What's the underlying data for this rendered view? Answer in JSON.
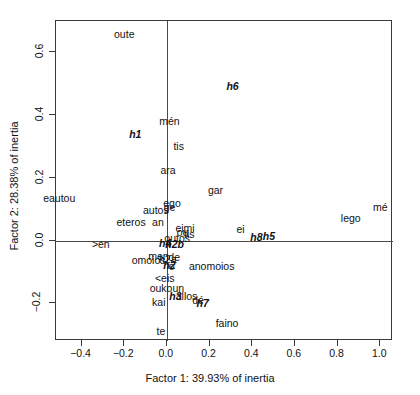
{
  "chart_data": {
    "type": "scatter",
    "title": "",
    "subtitle": "",
    "xlabel": "Factor 1: 39.93% of inertia",
    "ylabel": "Factor 2: 28.38% of inertia",
    "xlim": [
      -0.52,
      1.06
    ],
    "ylim": [
      -0.32,
      0.7
    ],
    "grid": false,
    "legend": "none",
    "xticks": [
      "-0.4",
      "-0.2",
      "0.0",
      "0.2",
      "0.4",
      "0.6",
      "0.8",
      "1.0"
    ],
    "xtick_values": [
      -0.4,
      -0.2,
      0.0,
      0.2,
      0.4,
      0.6,
      0.8,
      1.0
    ],
    "yticks": [
      "-0.2",
      "0.0",
      "0.2",
      "0.4",
      "0.6"
    ],
    "ytick_values": [
      -0.2,
      0.0,
      0.2,
      0.4,
      0.6
    ],
    "reference_lines": {
      "vertical_x": 0.0,
      "horizontal_y": 0.0
    },
    "series": [
      {
        "name": "words",
        "style": "plain",
        "points": [
          {
            "label": "oute",
            "x": -0.2,
            "y": 0.66
          },
          {
            "label": "mén",
            "x": 0.012,
            "y": 0.38
          },
          {
            "label": "tis",
            "x": 0.055,
            "y": 0.3
          },
          {
            "label": "ara",
            "x": 0.005,
            "y": 0.225
          },
          {
            "label": "gar",
            "x": 0.228,
            "y": 0.16
          },
          {
            "label": "eautou",
            "x": -0.505,
            "y": 0.137
          },
          {
            "label": "ego",
            "x": 0.024,
            "y": 0.12
          },
          {
            "label": "ge",
            "x": 0.012,
            "y": 0.108
          },
          {
            "label": "autos",
            "x": -0.052,
            "y": 0.098
          },
          {
            "label": "mé",
            "x": 1.0,
            "y": 0.108
          },
          {
            "label": "lego",
            "x": 0.862,
            "y": 0.072
          },
          {
            "label": "eteros",
            "x": -0.168,
            "y": 0.058
          },
          {
            "label": "an",
            "x": -0.042,
            "y": 0.058
          },
          {
            "label": "eimi",
            "x": 0.085,
            "y": 0.04
          },
          {
            "label": "ou",
            "x": 0.073,
            "y": 0.026
          },
          {
            "label": "tis",
            "x": 0.105,
            "y": 0.022
          },
          {
            "label": "ei",
            "x": 0.345,
            "y": 0.036
          },
          {
            "label": "outos",
            "x": 0.048,
            "y": 0.008
          },
          {
            "label": ">en",
            "x": -0.31,
            "y": -0.01
          },
          {
            "label": "de",
            "x": 0.034,
            "y": -0.052
          },
          {
            "label": "men",
            "x": -0.04,
            "y": -0.048
          },
          {
            "label": "h2a",
            "x": 0.004,
            "y": -0.06
          },
          {
            "label": "omoios",
            "x": -0.086,
            "y": -0.062
          },
          {
            "label": "o",
            "x": 0.022,
            "y": -0.082
          },
          {
            "label": "anomoios",
            "x": 0.21,
            "y": -0.082
          },
          {
            "label": "<eis",
            "x": -0.01,
            "y": -0.118
          },
          {
            "label": "oukoun",
            "x": 0.0,
            "y": -0.152
          },
          {
            "label": "allos",
            "x": 0.092,
            "y": -0.176
          },
          {
            "label": "dé",
            "x": 0.146,
            "y": -0.19
          },
          {
            "label": "kai",
            "x": -0.038,
            "y": -0.196
          },
          {
            "label": "faino",
            "x": 0.282,
            "y": -0.262
          },
          {
            "label": "te",
            "x": -0.028,
            "y": -0.288
          }
        ]
      },
      {
        "name": "speakers",
        "style": "bold-italic",
        "points": [
          {
            "label": "h6",
            "x": 0.308,
            "y": 0.492
          },
          {
            "label": "h1",
            "x": -0.148,
            "y": 0.34
          },
          {
            "label": "h8",
            "x": 0.42,
            "y": 0.012
          },
          {
            "label": "h5",
            "x": 0.478,
            "y": 0.016
          },
          {
            "label": "h4",
            "x": -0.008,
            "y": -0.008
          },
          {
            "label": "h2b",
            "x": 0.036,
            "y": -0.012
          },
          {
            "label": "h2",
            "x": 0.012,
            "y": -0.078
          },
          {
            "label": "h3",
            "x": 0.04,
            "y": -0.178
          },
          {
            "label": "h7",
            "x": 0.168,
            "y": -0.2
          }
        ]
      }
    ]
  }
}
